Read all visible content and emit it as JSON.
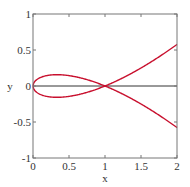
{
  "chart_data": {
    "type": "line",
    "title": "",
    "xlabel": "x",
    "ylabel": "y",
    "xlim": [
      0,
      2
    ],
    "ylim": [
      -1,
      1
    ],
    "xticks": [
      0,
      0.5,
      1,
      1.5,
      2
    ],
    "yticks": [
      -1,
      -0.5,
      0,
      0.5,
      1
    ],
    "xtick_labels": [
      "0",
      "0.5",
      "1",
      "1.5",
      "2"
    ],
    "ytick_labels": [
      "-1",
      "-0.5",
      "0",
      "0.5",
      "1"
    ],
    "grid": false,
    "legend": null,
    "curve_color": "#c8102e",
    "series": [
      {
        "name": "upper branch",
        "x": [
          0,
          0.1,
          0.2,
          0.333,
          0.5,
          0.7,
          0.9,
          1.0,
          1.2,
          1.4,
          1.6,
          1.8,
          2.0
        ],
        "y": [
          0,
          0.116,
          0.146,
          0.157,
          0.144,
          0.103,
          0.039,
          0,
          -0.045,
          -0.097,
          -0.155,
          -0.22,
          -0.577
        ]
      },
      {
        "name": "lower branch",
        "x": [
          0,
          0.1,
          0.2,
          0.333,
          0.5,
          0.7,
          0.9,
          1.0,
          1.2,
          1.4,
          1.6,
          1.8,
          2.0
        ],
        "y": [
          0,
          -0.116,
          -0.146,
          -0.157,
          -0.144,
          -0.103,
          -0.039,
          0,
          0.045,
          0.097,
          0.155,
          0.22,
          0.577
        ]
      }
    ],
    "reference_line": {
      "y": 0
    }
  }
}
